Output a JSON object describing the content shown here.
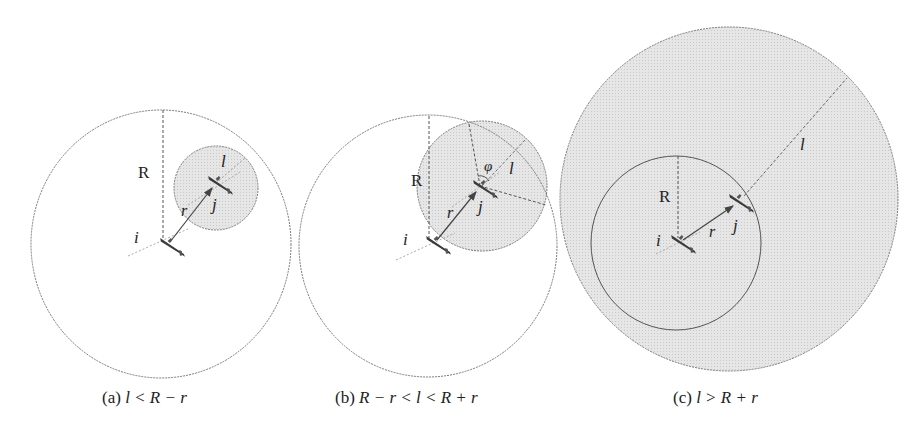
{
  "figure": {
    "colors": {
      "background": "#ffffff",
      "circle_stroke": "#7a7a7a",
      "shaded_fill": "#e2e2e2",
      "aircraft": "#3a3a3a",
      "text": "#222222"
    },
    "panels": [
      {
        "id": "a",
        "caption_prefix": "(a)",
        "caption_math": "l < R − r",
        "labels": {
          "R": "R",
          "r": "r",
          "l": "l",
          "i": "i",
          "j": "j"
        },
        "condition": "protected zone of j lies entirely inside R-circle of i"
      },
      {
        "id": "b",
        "caption_prefix": "(b)",
        "caption_math": "R − r < l < R + r",
        "labels": {
          "R": "R",
          "r": "r",
          "l": "l",
          "i": "i",
          "j": "j",
          "phi": "φ"
        },
        "condition": "circles intersect; angle φ subtended at j"
      },
      {
        "id": "c",
        "caption_prefix": "(c)",
        "caption_math": "l > R + r",
        "labels": {
          "R": "R",
          "r": "r",
          "l": "l",
          "i": "i",
          "j": "j"
        },
        "condition": "R-circle of i lies entirely inside l-circle of j"
      }
    ]
  }
}
